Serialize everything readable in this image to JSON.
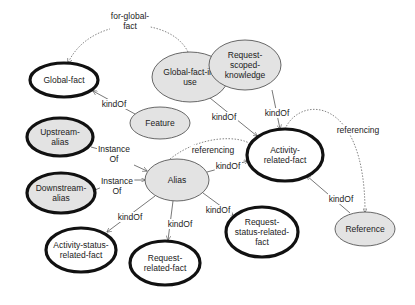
{
  "diagram": {
    "nodes": [
      {
        "id": "global-fact",
        "label_lines": [
          "Global-fact"
        ],
        "cx": 64,
        "cy": 80,
        "rx": 34,
        "ry": 17,
        "fill": "#ffffff",
        "border": "thick"
      },
      {
        "id": "global-fact-in-use",
        "label_lines": [
          "Global-fact-in-",
          "use"
        ],
        "cx": 190,
        "cy": 77,
        "rx": 38,
        "ry": 25,
        "fill": "#e3e3e3",
        "border": "thin"
      },
      {
        "id": "request-scoped-knowledge",
        "label_lines": [
          "Request-",
          "scoped-",
          "knowledge"
        ],
        "cx": 245,
        "cy": 65,
        "rx": 36,
        "ry": 25,
        "fill": "#e3e3e3",
        "border": "thin"
      },
      {
        "id": "feature",
        "label_lines": [
          "Feature"
        ],
        "cx": 160,
        "cy": 123,
        "rx": 30,
        "ry": 16,
        "fill": "#e3e3e3",
        "border": "thin"
      },
      {
        "id": "upstream-alias",
        "label_lines": [
          "Upstream-",
          "alias"
        ],
        "cx": 60,
        "cy": 137,
        "rx": 33,
        "ry": 19,
        "fill": "#e3e3e3",
        "border": "thick"
      },
      {
        "id": "activity-related-fact",
        "label_lines": [
          "Activity-",
          "related-fact"
        ],
        "cx": 285,
        "cy": 155,
        "rx": 38,
        "ry": 26,
        "fill": "#ffffff",
        "border": "thick"
      },
      {
        "id": "alias",
        "label_lines": [
          "Alias"
        ],
        "cx": 177,
        "cy": 180,
        "rx": 32,
        "ry": 21,
        "fill": "#e3e3e3",
        "border": "thin"
      },
      {
        "id": "downstream-alias",
        "label_lines": [
          "Downstream-",
          "alias"
        ],
        "cx": 61,
        "cy": 193,
        "rx": 34,
        "ry": 20,
        "fill": "#e3e3e3",
        "border": "thick"
      },
      {
        "id": "reference",
        "label_lines": [
          "Reference"
        ],
        "cx": 365,
        "cy": 229,
        "rx": 30,
        "ry": 17,
        "fill": "#e3e3e3",
        "border": "thin"
      },
      {
        "id": "request-status-related-fact",
        "label_lines": [
          "Request-",
          "status-related-",
          "fact"
        ],
        "cx": 262,
        "cy": 232,
        "rx": 36,
        "ry": 25,
        "fill": "#ffffff",
        "border": "thick"
      },
      {
        "id": "activity-status-related-fact",
        "label_lines": [
          "Activity-status-",
          "related-fact"
        ],
        "cx": 81,
        "cy": 250,
        "rx": 35,
        "ry": 22,
        "fill": "#ffffff",
        "border": "thick"
      },
      {
        "id": "request-related-fact",
        "label_lines": [
          "Request-",
          "related-fact"
        ],
        "cx": 165,
        "cy": 263,
        "rx": 35,
        "ry": 22,
        "fill": "#ffffff",
        "border": "thick"
      }
    ],
    "edges": [
      {
        "from": "global-fact-in-use",
        "to": "global-fact",
        "label_lines": [
          "for-global-",
          "fact"
        ],
        "style": "dotted",
        "path": "M 188 52 C 170 15, 90 15, 68 63",
        "lx": 130,
        "ly": 21
      },
      {
        "from": "feature",
        "to": "global-fact",
        "label_lines": [
          "kindOf"
        ],
        "style": "solid",
        "path": "M 135 114 L 93 91",
        "lx": 114,
        "ly": 104
      },
      {
        "from": "global-fact-in-use",
        "to": "activity-related-fact",
        "label_lines": [
          "kindOf"
        ],
        "style": "solid",
        "path": "M 210 98 L 257 136",
        "lx": 224,
        "ly": 117
      },
      {
        "from": "request-scoped-knowledge",
        "to": "activity-related-fact",
        "label_lines": [
          "kindOf"
        ],
        "style": "solid",
        "path": "M 272 90 L 280 129",
        "lx": 277,
        "ly": 113
      },
      {
        "from": "upstream-alias",
        "to": "alias",
        "label_lines": [
          "Instance",
          "Of"
        ],
        "style": "solid",
        "path": "M 91 147 L 102 150 M 134 165 L 147 171",
        "lx": 114,
        "ly": 154
      },
      {
        "from": "downstream-alias",
        "to": "alias",
        "label_lines": [
          "Instance",
          "Of"
        ],
        "style": "solid",
        "path": "M 95 190 L 102 187 M 133 180 L 145 180",
        "lx": 117,
        "ly": 186
      },
      {
        "from": "alias",
        "to": "activity-related-fact",
        "label_lines": [
          "referencing"
        ],
        "style": "dotted",
        "path": "M 170 159 C 200 135, 240 135, 252 145",
        "lx": 213,
        "ly": 150
      },
      {
        "from": "alias",
        "to": "activity-related-fact",
        "label_lines": [
          "kindOf"
        ],
        "style": "solid",
        "path": "M 207 172 L 248 161",
        "lx": 228,
        "ly": 166
      },
      {
        "from": "activity-related-fact",
        "to": "activity-related-fact",
        "label_lines": [
          "referencing"
        ],
        "style": "dotted",
        "path": "M 285 129 C 300 95, 365 95, 365 212",
        "lx": 358,
        "ly": 130
      },
      {
        "from": "reference",
        "to": "activity-related-fact",
        "label_lines": [
          "kindOf"
        ],
        "style": "solid",
        "path": "M 350 213 L 307 176",
        "lx": 341,
        "ly": 199
      },
      {
        "from": "alias",
        "to": "request-status-related-fact",
        "label_lines": [
          "kindOf"
        ],
        "style": "solid",
        "path": "M 203 193 L 233 215",
        "lx": 218,
        "ly": 210
      },
      {
        "from": "alias",
        "to": "activity-status-related-fact",
        "label_lines": [
          "kindOf"
        ],
        "style": "solid",
        "path": "M 155 196 L 107 232",
        "lx": 130,
        "ly": 217
      },
      {
        "from": "alias",
        "to": "request-related-fact",
        "label_lines": [
          "kindOf"
        ],
        "style": "solid",
        "path": "M 173 201 L 168 240",
        "lx": 180,
        "ly": 224
      }
    ]
  }
}
